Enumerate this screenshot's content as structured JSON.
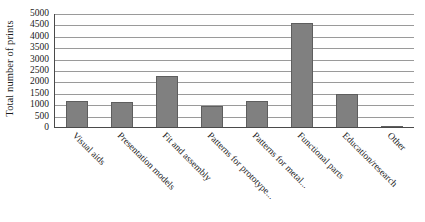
{
  "chart_data": {
    "type": "bar",
    "title": "",
    "xlabel": "",
    "ylabel": "Total number of prints",
    "categories": [
      "Visual aids",
      "Presentation models",
      "Fit and assembly",
      "Patterns for prototype...",
      "Patterns for metal...",
      "Functional parts",
      "Education/research",
      "Other"
    ],
    "values": [
      1200,
      1150,
      2300,
      950,
      1200,
      4600,
      1500,
      100
    ],
    "ylim": [
      0,
      5000
    ],
    "ytick_step": 500,
    "yticks": [
      "5000",
      "4500",
      "4000",
      "3500",
      "3000",
      "2500",
      "2000",
      "1500",
      "1000",
      "500",
      "0"
    ],
    "grid": true,
    "legend": false,
    "bar_color": "#808080",
    "bar_edge_color": "#5e5e5e",
    "grid_color": "#9a9a9a",
    "axis_color": "#4a4a4a",
    "label_rotation": 45
  }
}
